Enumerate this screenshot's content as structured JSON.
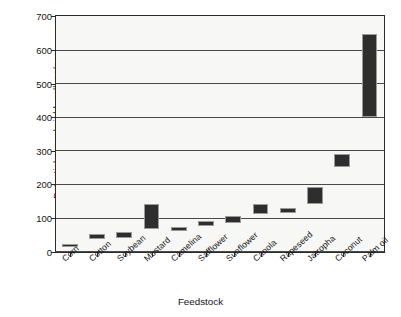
{
  "chart_data": {
    "type": "bar",
    "subtype": "floating-range-bar",
    "title": "",
    "xlabel": "Feedstock",
    "ylabel": "Potential annual yield, gallons/acre",
    "ylim": [
      0,
      700
    ],
    "yticks": [
      0,
      100,
      200,
      300,
      400,
      500,
      600,
      700
    ],
    "grid": true,
    "legend": "none",
    "categories": [
      "Corn",
      "Cotton",
      "Soybean",
      "Mustard",
      "Camelina",
      "Safflower",
      "Sunflower",
      "Canola",
      "Rapeseed",
      "Jatropha",
      "Coconut",
      "Palm oil"
    ],
    "series": [
      {
        "name": "Potential annual yield range",
        "low": [
          15,
          35,
          40,
          65,
          60,
          75,
          85,
          110,
          115,
          140,
          250,
          400
        ],
        "high": [
          22,
          50,
          58,
          140,
          72,
          90,
          105,
          140,
          128,
          190,
          290,
          645
        ]
      }
    ],
    "bar_color": "#2e2e2e",
    "plot_background": "#f7f7f6",
    "axis_color": "#2b2b2b",
    "figure_background": "#ffffff"
  }
}
